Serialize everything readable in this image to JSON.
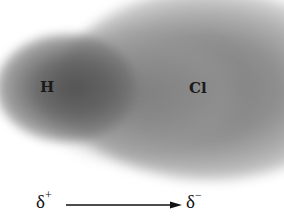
{
  "diagram": {
    "atoms": [
      {
        "symbol": "H"
      },
      {
        "symbol": "Cl"
      }
    ],
    "polarity": {
      "positive_label": "δ",
      "positive_sign": "+",
      "negative_label": "δ",
      "negative_sign": "−",
      "arrow_direction": "right"
    },
    "colors": {
      "cloud_dark": "#505050",
      "cloud_mid": "#828282",
      "background": "#ffffff",
      "text": "#1a1a1a"
    }
  }
}
